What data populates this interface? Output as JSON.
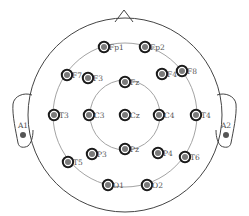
{
  "diagram": {
    "colors": {
      "outline": "#444444",
      "ring": "#999999",
      "electrode_outer": "#1a1a1a",
      "electrode_fill": "#7a7a7a",
      "label": "#555555"
    },
    "electrodes": [
      {
        "id": "Fp1",
        "label": "Fp1"
      },
      {
        "id": "Fp2",
        "label": "Fp2"
      },
      {
        "id": "F7",
        "label": "F7"
      },
      {
        "id": "F3",
        "label": "F3"
      },
      {
        "id": "Fz",
        "label": "Fz"
      },
      {
        "id": "F4",
        "label": "F4"
      },
      {
        "id": "F8",
        "label": "F8"
      },
      {
        "id": "T3",
        "label": "T3"
      },
      {
        "id": "C3",
        "label": "C3"
      },
      {
        "id": "Cz",
        "label": "Cz"
      },
      {
        "id": "C4",
        "label": "C4"
      },
      {
        "id": "T4",
        "label": "T4"
      },
      {
        "id": "T5",
        "label": "T5"
      },
      {
        "id": "P3",
        "label": "P3"
      },
      {
        "id": "Pz",
        "label": "Pz"
      },
      {
        "id": "P4",
        "label": "P4"
      },
      {
        "id": "T6",
        "label": "T6"
      },
      {
        "id": "O1",
        "label": "O1"
      },
      {
        "id": "O2",
        "label": "O2"
      }
    ],
    "ear_electrodes": [
      {
        "id": "A1",
        "label": "A1"
      },
      {
        "id": "A2",
        "label": "A2"
      }
    ]
  }
}
